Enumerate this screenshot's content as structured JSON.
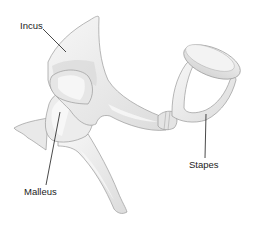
{
  "diagram": {
    "labels": [
      {
        "id": "incus",
        "text": "Incus",
        "x": 20,
        "y": 29
      },
      {
        "id": "malleus",
        "text": "Malleus",
        "x": 24,
        "y": 195
      },
      {
        "id": "stapes",
        "text": "Stapes",
        "x": 189,
        "y": 168
      }
    ],
    "colors": {
      "background": "#ffffff",
      "bone_light": "#f3f3f3",
      "bone_mid": "#e2e2e2",
      "bone_shadow": "#cfcfcf",
      "outline": "#9a9a9a",
      "leader_line": "#1a1a1a",
      "label_text": "#222222"
    }
  }
}
